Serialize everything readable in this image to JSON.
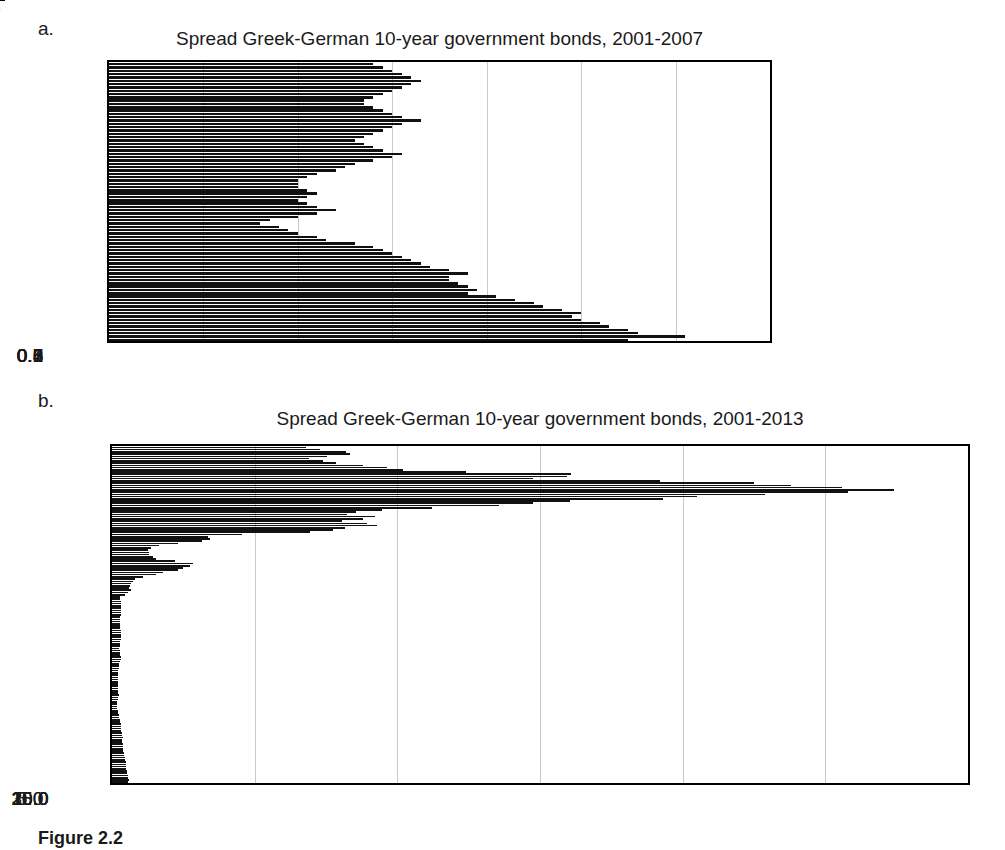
{
  "figure": {
    "caption": "Figure 2.2"
  },
  "panels": [
    {
      "letter": "a.",
      "title": "Spread Greek-German 10-year government bonds, 2001-2007"
    },
    {
      "letter": "b.",
      "title": "Spread Greek-German 10-year government bonds, 2001-2013"
    }
  ],
  "chart_data": [
    {
      "id": "panel-a",
      "type": "bar",
      "orientation": "horizontal",
      "title": "Spread Greek-German 10-year government bonds, 2001-2007",
      "xlabel": "",
      "ylabel": "",
      "xlim": [
        0.0,
        0.7
      ],
      "xticks": [
        0.0,
        0.1,
        0.2,
        0.3,
        0.4,
        0.5,
        0.6,
        0.7
      ],
      "xtick_labels": [
        "0.0",
        "0.1",
        "0.2",
        "0.3",
        "0.4",
        "0.5",
        "0.6",
        "0.7"
      ],
      "grid": true,
      "legend": "none",
      "ytick_labels": [
        "Jul-07",
        "Jan-07",
        "Jul-06",
        "Jan-06",
        "Jul-05",
        "Jan-05",
        "Jul-04",
        "Jan-04",
        "Jul-03",
        "Jan-03",
        "Jul-02",
        "Jan-02",
        "Jul-01",
        "Jan-01"
      ],
      "categories": [
        "Jan-01",
        "Feb-01",
        "Mar-01",
        "Apr-01",
        "May-01",
        "Jun-01",
        "Jul-01",
        "Aug-01",
        "Sep-01",
        "Oct-01",
        "Nov-01",
        "Dec-01",
        "Jan-02",
        "Feb-02",
        "Mar-02",
        "Apr-02",
        "May-02",
        "Jun-02",
        "Jul-02",
        "Aug-02",
        "Sep-02",
        "Oct-02",
        "Nov-02",
        "Dec-02",
        "Jan-03",
        "Feb-03",
        "Mar-03",
        "Apr-03",
        "May-03",
        "Jun-03",
        "Jul-03",
        "Aug-03",
        "Sep-03",
        "Oct-03",
        "Nov-03",
        "Dec-03",
        "Jan-04",
        "Feb-04",
        "Mar-04",
        "Apr-04",
        "May-04",
        "Jun-04",
        "Jul-04",
        "Aug-04",
        "Sep-04",
        "Oct-04",
        "Nov-04",
        "Dec-04",
        "Jan-05",
        "Feb-05",
        "Mar-05",
        "Apr-05",
        "May-05",
        "Jun-05",
        "Jul-05",
        "Aug-05",
        "Sep-05",
        "Oct-05",
        "Nov-05",
        "Dec-05",
        "Jan-06",
        "Feb-06",
        "Mar-06",
        "Apr-06",
        "May-06",
        "Jun-06",
        "Jul-06",
        "Aug-06",
        "Sep-06",
        "Oct-06",
        "Nov-06",
        "Dec-06",
        "Jan-07",
        "Feb-07",
        "Mar-07",
        "Apr-07",
        "May-07",
        "Jun-07",
        "Jul-07",
        "Aug-07",
        "Sep-07",
        "Oct-07",
        "Nov-07",
        "Dec-07"
      ],
      "values": [
        0.55,
        0.61,
        0.56,
        0.55,
        0.53,
        0.52,
        0.5,
        0.49,
        0.5,
        0.48,
        0.46,
        0.45,
        0.43,
        0.41,
        0.38,
        0.39,
        0.38,
        0.37,
        0.36,
        0.36,
        0.38,
        0.36,
        0.34,
        0.33,
        0.32,
        0.31,
        0.3,
        0.29,
        0.28,
        0.26,
        0.23,
        0.22,
        0.2,
        0.19,
        0.18,
        0.16,
        0.17,
        0.2,
        0.22,
        0.24,
        0.22,
        0.21,
        0.2,
        0.21,
        0.22,
        0.21,
        0.2,
        0.2,
        0.2,
        0.21,
        0.22,
        0.24,
        0.25,
        0.26,
        0.28,
        0.3,
        0.31,
        0.29,
        0.28,
        0.27,
        0.26,
        0.27,
        0.28,
        0.29,
        0.3,
        0.31,
        0.33,
        0.31,
        0.3,
        0.29,
        0.28,
        0.27,
        0.27,
        0.28,
        0.29,
        0.3,
        0.31,
        0.32,
        0.33,
        0.32,
        0.31,
        0.3,
        0.29,
        0.28
      ]
    },
    {
      "id": "panel-b",
      "type": "bar",
      "orientation": "horizontal",
      "title": "Spread Greek-German 10-year government bonds, 2001-2013",
      "xlabel": "",
      "ylabel": "",
      "xlim": [
        0.0,
        30.0
      ],
      "xticks": [
        0.0,
        5.0,
        10.0,
        15.0,
        20.0,
        25.0,
        30.0
      ],
      "xtick_labels": [
        "0.0",
        "5.0",
        "10.0",
        "15.0",
        "20.0",
        "25.0",
        "30.0"
      ],
      "grid": true,
      "legend": "none",
      "ytick_labels": [
        "Jul-13",
        "Jan-13",
        "Jul-12",
        "Jan-12",
        "Jul-11",
        "Jan-11",
        "Jul-10",
        "Jan-10",
        "Jul-09",
        "Jan-09",
        "Jul-08",
        "Jan-08",
        "Jul-07",
        "Jan-07",
        "Jul-06",
        "Jan-06",
        "Jul-05",
        "Jan-05",
        "Jul-04",
        "Jan-04",
        "Jul-03",
        "Jan-03",
        "Jul-02",
        "Jan-02",
        "Jul-01",
        "Jan-01"
      ],
      "categories": [
        "Jan-01",
        "Feb-01",
        "Mar-01",
        "Apr-01",
        "May-01",
        "Jun-01",
        "Jul-01",
        "Aug-01",
        "Sep-01",
        "Oct-01",
        "Nov-01",
        "Dec-01",
        "Jan-02",
        "Feb-02",
        "Mar-02",
        "Apr-02",
        "May-02",
        "Jun-02",
        "Jul-02",
        "Aug-02",
        "Sep-02",
        "Oct-02",
        "Nov-02",
        "Dec-02",
        "Jan-03",
        "Feb-03",
        "Mar-03",
        "Apr-03",
        "May-03",
        "Jun-03",
        "Jul-03",
        "Aug-03",
        "Sep-03",
        "Oct-03",
        "Nov-03",
        "Dec-03",
        "Jan-04",
        "Feb-04",
        "Mar-04",
        "Apr-04",
        "May-04",
        "Jun-04",
        "Jul-04",
        "Aug-04",
        "Sep-04",
        "Oct-04",
        "Nov-04",
        "Dec-04",
        "Jan-05",
        "Feb-05",
        "Mar-05",
        "Apr-05",
        "May-05",
        "Jun-05",
        "Jul-05",
        "Aug-05",
        "Sep-05",
        "Oct-05",
        "Nov-05",
        "Dec-05",
        "Jan-06",
        "Feb-06",
        "Mar-06",
        "Apr-06",
        "May-06",
        "Jun-06",
        "Jul-06",
        "Aug-06",
        "Sep-06",
        "Oct-06",
        "Nov-06",
        "Dec-06",
        "Jan-07",
        "Feb-07",
        "Mar-07",
        "Apr-07",
        "May-07",
        "Jun-07",
        "Jul-07",
        "Aug-07",
        "Sep-07",
        "Oct-07",
        "Nov-07",
        "Dec-07",
        "Jan-08",
        "Feb-08",
        "Mar-08",
        "Apr-08",
        "May-08",
        "Jun-08",
        "Jul-08",
        "Aug-08",
        "Sep-08",
        "Oct-08",
        "Nov-08",
        "Dec-08",
        "Jan-09",
        "Feb-09",
        "Mar-09",
        "Apr-09",
        "May-09",
        "Jun-09",
        "Jul-09",
        "Aug-09",
        "Sep-09",
        "Oct-09",
        "Nov-09",
        "Dec-09",
        "Jan-10",
        "Feb-10",
        "Mar-10",
        "Apr-10",
        "May-10",
        "Jun-10",
        "Jul-10",
        "Aug-10",
        "Sep-10",
        "Oct-10",
        "Nov-10",
        "Dec-10",
        "Jan-11",
        "Feb-11",
        "Mar-11",
        "Apr-11",
        "May-11",
        "Jun-11",
        "Jul-11",
        "Aug-11",
        "Sep-11",
        "Oct-11",
        "Nov-11",
        "Dec-11",
        "Jan-12",
        "Feb-12",
        "Mar-12",
        "Apr-12",
        "May-12",
        "Jun-12",
        "Jul-12",
        "Aug-12",
        "Sep-12",
        "Oct-12",
        "Nov-12",
        "Dec-12",
        "Jan-13",
        "Feb-13",
        "Mar-13",
        "Apr-13",
        "May-13",
        "Jun-13",
        "Jul-13"
      ],
      "values": [
        0.55,
        0.61,
        0.56,
        0.55,
        0.53,
        0.52,
        0.5,
        0.49,
        0.5,
        0.48,
        0.46,
        0.45,
        0.43,
        0.41,
        0.38,
        0.39,
        0.38,
        0.37,
        0.36,
        0.36,
        0.38,
        0.36,
        0.34,
        0.33,
        0.32,
        0.31,
        0.3,
        0.29,
        0.28,
        0.26,
        0.23,
        0.22,
        0.2,
        0.19,
        0.18,
        0.16,
        0.17,
        0.2,
        0.22,
        0.24,
        0.22,
        0.21,
        0.2,
        0.21,
        0.22,
        0.21,
        0.2,
        0.2,
        0.2,
        0.21,
        0.22,
        0.24,
        0.25,
        0.26,
        0.28,
        0.3,
        0.31,
        0.29,
        0.28,
        0.27,
        0.26,
        0.27,
        0.28,
        0.29,
        0.3,
        0.31,
        0.33,
        0.31,
        0.3,
        0.29,
        0.28,
        0.27,
        0.27,
        0.28,
        0.29,
        0.3,
        0.31,
        0.32,
        0.33,
        0.32,
        0.31,
        0.3,
        0.29,
        0.28,
        0.45,
        0.55,
        0.65,
        0.6,
        0.62,
        0.68,
        0.72,
        0.8,
        1.1,
        1.55,
        1.8,
        2.3,
        2.5,
        2.75,
        2.85,
        2.2,
        1.55,
        1.45,
        1.3,
        1.3,
        1.25,
        1.35,
        1.65,
        2.3,
        3.15,
        3.45,
        3.35,
        4.55,
        6.95,
        7.75,
        8.15,
        9.3,
        8.95,
        8.05,
        8.8,
        9.2,
        8.25,
        8.55,
        9.45,
        11.2,
        13.55,
        14.75,
        16.05,
        19.3,
        20.5,
        22.9,
        25.8,
        27.4,
        25.6,
        23.8,
        22.5,
        19.2,
        14.75,
        15.95,
        16.1,
        12.4,
        10.2,
        9.65,
        8.8,
        7.85,
        7.4,
        6.9,
        7.55,
        8.35,
        8.2,
        7.3,
        6.8
      ]
    }
  ]
}
